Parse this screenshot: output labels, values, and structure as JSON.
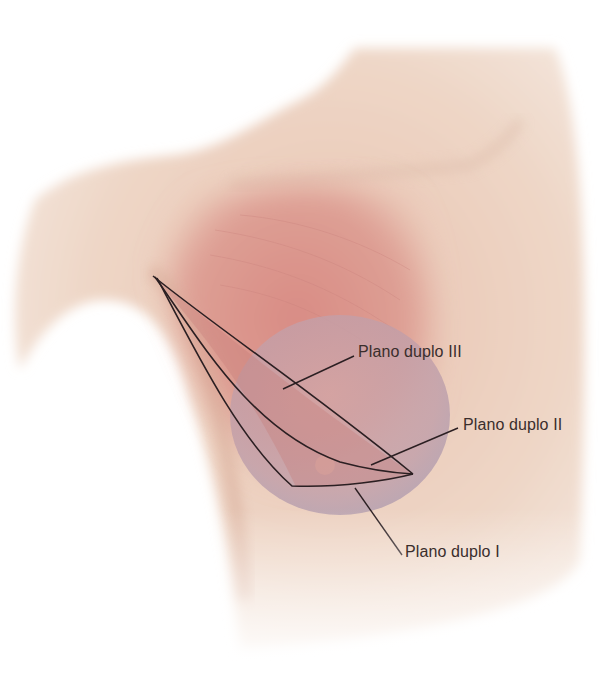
{
  "figure": {
    "colors": {
      "background": "#ffffff",
      "skin": "#eed8c8",
      "skin_shadow": "#d9aa96",
      "pectoral_muscle": "#d88f88",
      "implant": "#b89aa8",
      "dual_plane_region": "#c77f78",
      "outline": "#2b1f22"
    }
  },
  "labels": [
    {
      "id": "plano-duplo-iii",
      "text": "Plano duplo III",
      "x": 358,
      "y": 343
    },
    {
      "id": "plano-duplo-ii",
      "text": "Plano duplo II",
      "x": 463,
      "y": 416
    },
    {
      "id": "plano-duplo-i",
      "text": "Plano duplo I",
      "x": 405,
      "y": 543
    }
  ]
}
